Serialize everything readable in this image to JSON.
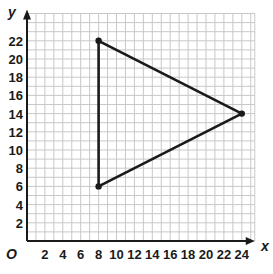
{
  "chart_data": {
    "type": "line",
    "title": "",
    "xlabel": "x",
    "ylabel": "y",
    "origin_label": "O",
    "xlim": [
      0,
      25
    ],
    "ylim": [
      0,
      25
    ],
    "grid": true,
    "grid_step": 1,
    "x_ticks": [
      2,
      4,
      6,
      8,
      10,
      12,
      14,
      16,
      18,
      20,
      22,
      24
    ],
    "y_ticks": [
      2,
      4,
      6,
      8,
      10,
      12,
      14,
      16,
      18,
      20,
      22
    ],
    "series": [
      {
        "name": "triangle",
        "closed": true,
        "points": [
          {
            "x": 8,
            "y": 22
          },
          {
            "x": 24,
            "y": 14
          },
          {
            "x": 8,
            "y": 6
          }
        ]
      }
    ],
    "legend": null
  },
  "colors": {
    "grid": "#c8c8c8",
    "axis": "#1a1a1a",
    "shape": "#1a1a1a"
  }
}
